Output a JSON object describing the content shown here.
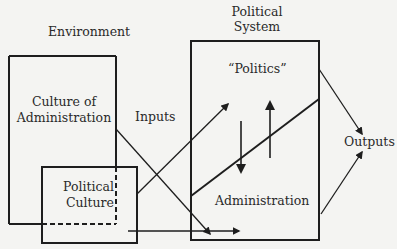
{
  "diagram": {
    "labels": {
      "environment": "Environment",
      "political_system_line1": "Political",
      "political_system_line2": "System",
      "politics": "“Politics”",
      "culture_admin_line1": "Culture of",
      "culture_admin_line2": "Administration",
      "inputs": "Inputs",
      "political_culture_line1": "Political",
      "political_culture_line2": "Culture",
      "administration": "Administration",
      "outputs": "Outputs"
    },
    "colors": {
      "line": "#1e1e1e",
      "background": "#f4f4f2"
    }
  }
}
